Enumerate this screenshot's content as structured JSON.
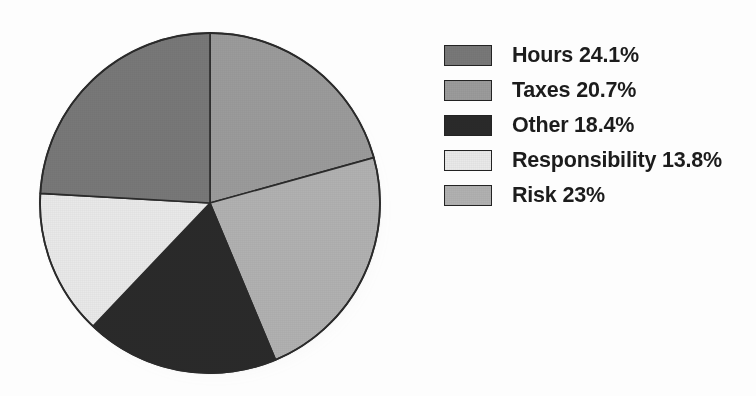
{
  "chart_data": {
    "type": "pie",
    "title": "",
    "labels": [
      "Hours",
      "Taxes",
      "Other",
      "Responsibility",
      "Risk"
    ],
    "values": [
      24.1,
      20.7,
      18.4,
      13.8,
      23
    ],
    "value_suffix": "%",
    "legend_position": "right",
    "grid": false,
    "slice_order_clockwise_from_top": [
      "Taxes",
      "Risk",
      "Other",
      "Responsibility",
      "Hours"
    ],
    "colors": {
      "Hours": "#787878",
      "Taxes": "#9b9b9b",
      "Other": "#2a2a2a",
      "Responsibility": "#e9e9e9",
      "Risk": "#b1b1b1"
    },
    "legend_entries": [
      {
        "label": "Hours",
        "value": 24.1,
        "text": "Hours 24.1%",
        "color": "#787878"
      },
      {
        "label": "Taxes",
        "value": 20.7,
        "text": "Taxes 20.7%",
        "color": "#9b9b9b"
      },
      {
        "label": "Other",
        "value": 18.4,
        "text": "Other 18.4%",
        "color": "#2a2a2a"
      },
      {
        "label": "Responsibility",
        "value": 13.8,
        "text": "Responsibility 13.8%",
        "color": "#e9e9e9"
      },
      {
        "label": "Risk",
        "value": 23,
        "text": "Risk 23%",
        "color": "#b1b1b1"
      }
    ]
  },
  "geometry": {
    "center_x": 172,
    "center_y": 172,
    "radius": 170,
    "start_angle_deg": 0
  }
}
